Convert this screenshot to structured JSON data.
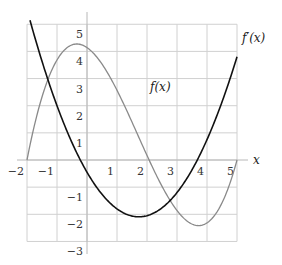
{
  "chart_data": {
    "type": "line",
    "title": "",
    "xlabel": "x",
    "ylabel": "",
    "xlim": [
      -2.5,
      5.5
    ],
    "ylim": [
      -3,
      5.5
    ],
    "grid": true,
    "legend": "inline labels",
    "x_ticks": [
      "−2",
      "−1",
      "1",
      "2",
      "3",
      "4",
      "5"
    ],
    "y_ticks": [
      "5",
      "4",
      "3",
      "2",
      "1",
      "−1",
      "−2",
      "−3"
    ],
    "series": [
      {
        "name": "f(x)",
        "label": "f(x)",
        "color": "#808080",
        "formula": "0.2*(x+2)*(x-2.07)*(x-5)",
        "x": [
          -2,
          -1.5,
          -1,
          -0.5,
          0,
          0.5,
          1,
          1.5,
          2,
          2.5,
          3,
          3.5,
          4,
          4.5,
          5
        ],
        "values": [
          0,
          2.15,
          3.55,
          4.15,
          4.14,
          3.6,
          2.62,
          1.3,
          -0.07,
          -1.24,
          -2.05,
          -2.45,
          -2.3,
          -1.53,
          0
        ]
      },
      {
        "name": "f'(x)",
        "label": "f′(x)",
        "color": "#111111",
        "formula": "0.55*x^2 - 1.9*x - 0.45",
        "x": [
          -1.87,
          -1.5,
          -1,
          -0.5,
          0,
          0.5,
          1,
          1.5,
          2,
          2.5,
          3,
          3.5,
          4,
          4.5,
          5
        ],
        "values": [
          5.02,
          3.64,
          2.0,
          0.64,
          -0.45,
          -1.26,
          -1.8,
          -2.06,
          -2.05,
          -1.76,
          -1.2,
          -0.36,
          0.75,
          2.14,
          3.8
        ]
      }
    ]
  },
  "labels": {
    "x_axis": "x",
    "f_curve": "f(x)",
    "fprime_curve": "f′(x)"
  }
}
